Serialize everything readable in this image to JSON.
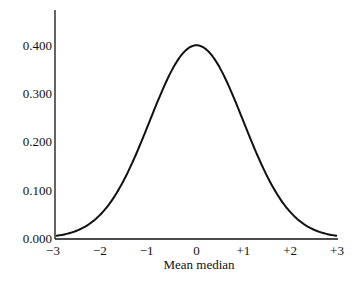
{
  "chart_data": {
    "type": "line",
    "title": "",
    "xlabel": "Mean median",
    "ylabel": "",
    "xlim": [
      -3,
      3
    ],
    "ylim": [
      0,
      0.45
    ],
    "grid": false,
    "legend": null,
    "x_ticks": [
      "−3",
      "−2",
      "−1",
      "0",
      "+1",
      "+2",
      "+3"
    ],
    "x_tick_values": [
      -3,
      -2,
      -1,
      0,
      1,
      2,
      3
    ],
    "y_ticks": [
      "0.000",
      "0.100",
      "0.200",
      "0.300",
      "0.400"
    ],
    "y_tick_values": [
      0,
      0.1,
      0.2,
      0.3,
      0.4
    ],
    "series": [
      {
        "name": "Standard normal density",
        "x": [
          -3,
          -2.5,
          -2,
          -1.5,
          -1,
          -0.5,
          0,
          0.5,
          1,
          1.5,
          2,
          2.5,
          3
        ],
        "values": [
          0.004,
          0.018,
          0.054,
          0.13,
          0.242,
          0.352,
          0.399,
          0.352,
          0.242,
          0.13,
          0.054,
          0.018,
          0.004
        ]
      }
    ]
  },
  "layout": {
    "plot_left": 56,
    "plot_right": 337,
    "y_zero_px": 238,
    "px_per_unit_y": 483,
    "axis_top": 10,
    "line_color": "#111111"
  }
}
